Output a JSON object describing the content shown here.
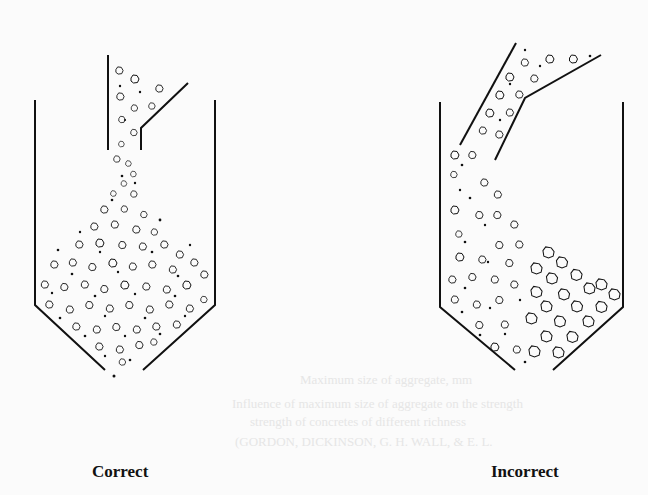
{
  "figure": {
    "panels": [
      {
        "id": "correct",
        "label": "Correct",
        "description": "Concrete poured vertically through a centered chute; mix falls straight down and remains uniform."
      },
      {
        "id": "incorrect",
        "label": "Incorrect",
        "description": "Concrete poured through an angled chute; coarse aggregate segregates to one side."
      }
    ]
  },
  "bleed_through": {
    "line1": "Maximum size of aggregate, mm",
    "line2": "Influence of maximum size of aggregate on the strength",
    "line3": "strength of concretes of different richness",
    "line4": "(GORDON, DICKINSON, G. H. WALL, & E. L."
  },
  "colors": {
    "ink": "#111111",
    "paper": "#fbfbfb"
  }
}
